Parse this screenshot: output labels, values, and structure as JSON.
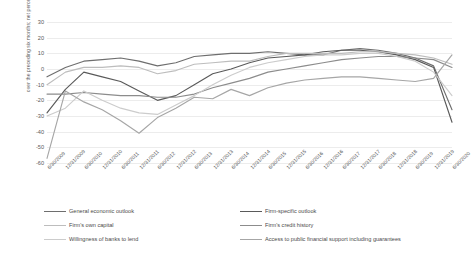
{
  "chart_data": {
    "type": "line",
    "title": "",
    "xlabel": "",
    "ylabel": "over the preceding six months; net percentages of respondents",
    "ylim": [
      -60,
      30
    ],
    "ytick_values": [
      30,
      20,
      10,
      0,
      -10,
      -20,
      -30,
      -40,
      -50,
      -60
    ],
    "ytick_labels": [
      "30",
      "20",
      "10",
      "0",
      "-10",
      "-20",
      "-30",
      "-40",
      "-50",
      "-60"
    ],
    "grid": true,
    "legend_position": "bottom",
    "categories": [
      "6/30/2009",
      "12/31/2009",
      "6/30/2010",
      "12/31/2010",
      "6/30/2011",
      "12/31/2011",
      "6/30/2012",
      "12/31/2012",
      "6/30/2013",
      "12/31/2013",
      "6/30/2014",
      "12/31/2014",
      "6/30/2015",
      "12/31/2015",
      "6/30/2016",
      "12/31/2016",
      "6/30/2017",
      "12/31/2017",
      "6/30/2018",
      "12/31/2018",
      "6/30/2019",
      "12/31/2019",
      "6/30/2020"
    ],
    "series": [
      {
        "name": "General economic outlook",
        "color": "#6e6e6e",
        "values": [
          -5,
          1,
          5,
          6,
          7,
          5,
          2,
          4,
          8,
          9,
          10,
          10,
          11,
          10,
          9,
          9,
          12,
          13,
          12,
          10,
          7,
          2,
          -26
        ]
      },
      {
        "name": "Firm-specific outlook",
        "color": "#5a5a5a",
        "values": [
          -28,
          -13,
          -2,
          -5,
          -8,
          -14,
          -20,
          -17,
          -10,
          -3,
          0,
          4,
          7,
          8,
          9,
          11,
          12,
          12,
          11,
          9,
          6,
          1,
          -34
        ]
      },
      {
        "name": "Firm's own capital",
        "color": "#bdbdbd",
        "values": [
          -10,
          -2,
          1,
          1,
          2,
          1,
          -3,
          -1,
          3,
          4,
          5,
          5,
          8,
          10,
          10,
          10,
          10,
          11,
          11,
          10,
          9,
          7,
          3
        ]
      },
      {
        "name": "Firm's credit history",
        "color": "#8c8c8c",
        "values": [
          -16,
          -16,
          -15,
          -16,
          -17,
          -17,
          -18,
          -18,
          -16,
          -12,
          -9,
          -6,
          -2,
          0,
          2,
          4,
          6,
          7,
          8,
          8,
          7,
          6,
          1
        ]
      },
      {
        "name": "Willingness of banks to lend",
        "color": "#cccccc",
        "values": [
          -30,
          -25,
          -14,
          -20,
          -25,
          -28,
          -29,
          -23,
          -17,
          -10,
          -4,
          1,
          4,
          6,
          8,
          9,
          9,
          10,
          10,
          8,
          5,
          -2,
          -17
        ]
      },
      {
        "name": "Access to public financial support including guarantees",
        "color": "#a6a6a6",
        "values": [
          -57,
          -14,
          -21,
          -26,
          -33,
          -41,
          -31,
          -25,
          -18,
          -19,
          -13,
          -17,
          -12,
          -9,
          -7,
          -6,
          -5,
          -5,
          -6,
          -7,
          -8,
          -6,
          9
        ]
      }
    ]
  },
  "legend": {
    "items": [
      {
        "label": "General economic outlook",
        "color": "#6e6e6e"
      },
      {
        "label": "Firm-specific outlook",
        "color": "#5a5a5a"
      },
      {
        "label": "Firm's own capital",
        "color": "#bdbdbd"
      },
      {
        "label": "Firm's credit history",
        "color": "#8c8c8c"
      },
      {
        "label": "Willingness of banks to lend",
        "color": "#cccccc"
      },
      {
        "label": "Access to public financial support including guarantees",
        "color": "#a6a6a6"
      }
    ]
  }
}
